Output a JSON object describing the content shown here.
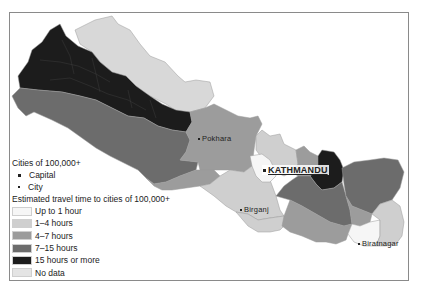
{
  "map": {
    "subject": "Nepal",
    "colors": {
      "up_to_1_hour": "#f6f6f6",
      "1_4_hours": "#cfcfcf",
      "4_7_hours": "#9c9c9c",
      "7_15_hours": "#6c6c6c",
      "15_hours_or_more": "#1c1c1c",
      "no_data": "#e4e4e4",
      "border": "#8a8a8a"
    },
    "cities": [
      {
        "name": "Pokhara",
        "type": "city"
      },
      {
        "name": "KATHMANDU",
        "type": "capital"
      },
      {
        "name": "Birganj",
        "type": "city"
      },
      {
        "name": "Biratnagar",
        "type": "city"
      }
    ]
  },
  "legend": {
    "cities_heading": "Cities of 100,000+",
    "capital_label": "Capital",
    "city_label": "City",
    "travel_heading": "Estimated travel time to cities of 100,000+",
    "classes": [
      {
        "label": "Up to 1 hour",
        "color": "#f6f6f6"
      },
      {
        "label": "1–4 hours",
        "color": "#cfcfcf"
      },
      {
        "label": "4–7 hours",
        "color": "#9c9c9c"
      },
      {
        "label": "7–15 hours",
        "color": "#6c6c6c"
      },
      {
        "label": "15 hours or more",
        "color": "#1c1c1c"
      },
      {
        "label": "No data",
        "color": "#e4e4e4"
      }
    ]
  }
}
